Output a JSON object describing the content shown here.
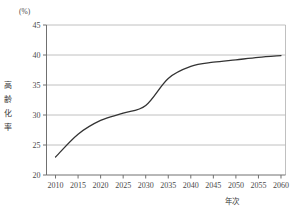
{
  "chart_data": {
    "type": "line",
    "title": "",
    "subtitle": "",
    "unit_label": "(%)",
    "xlabel": "年次",
    "ylabel": "高齢化率",
    "ylabel_chars": [
      "高",
      "齢",
      "化",
      "率"
    ],
    "x": [
      2010,
      2015,
      2020,
      2025,
      2030,
      2035,
      2040,
      2045,
      2050,
      2055,
      2060
    ],
    "values": [
      23.0,
      26.8,
      29.1,
      30.3,
      31.6,
      36.1,
      38.1,
      38.8,
      39.2,
      39.6,
      39.9
    ],
    "series": [
      {
        "name": "高齢化率",
        "values": [
          23.0,
          26.8,
          29.1,
          30.3,
          31.6,
          36.1,
          38.1,
          38.8,
          39.2,
          39.6,
          39.9
        ],
        "color": "#333333"
      }
    ],
    "xticks": [
      "2010",
      "2015",
      "2020",
      "2025",
      "2030",
      "2035",
      "2040",
      "2045",
      "2050",
      "2055",
      "2060"
    ],
    "yticks": [
      "20",
      "25",
      "30",
      "35",
      "40",
      "45"
    ],
    "xlim": [
      2008,
      2061
    ],
    "ylim": [
      20,
      45
    ],
    "grid": true,
    "grid_axis": "y",
    "legend": false,
    "legend_position": "none",
    "markers": false,
    "line_color": "#333333",
    "grid_color": "#b0b0b0",
    "axis_color": "#808080",
    "background": "#ffffff"
  }
}
